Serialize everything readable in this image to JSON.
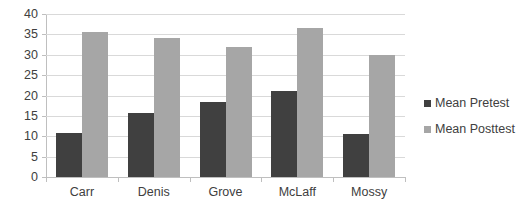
{
  "chart_data": {
    "type": "bar",
    "title": "",
    "xlabel": "",
    "ylabel": "",
    "categories": [
      "Carr",
      "Denis",
      "Grove",
      "McLaff",
      "Mossy"
    ],
    "series": [
      {
        "name": "Mean Pretest",
        "color": "#404040",
        "values": [
          10.8,
          15.8,
          18.3,
          21.0,
          10.5
        ]
      },
      {
        "name": "Mean Posttest",
        "color": "#a6a6a6",
        "values": [
          35.5,
          34.0,
          32.0,
          36.6,
          30.0
        ]
      }
    ],
    "ylim": [
      0,
      40
    ],
    "ytick_step": 5,
    "yticks": [
      40,
      35,
      30,
      25,
      20,
      15,
      10,
      5,
      0
    ],
    "ytick_labels": [
      "40",
      "35",
      "30",
      "25",
      "20",
      "15",
      "10",
      "5",
      "0"
    ],
    "grid": true,
    "grid_axis": "y",
    "legend": true,
    "legend_position": "right",
    "legend_entries": [
      "Mean Pretest",
      "Mean Posttest"
    ]
  },
  "colors": {
    "pretest": "#404040",
    "posttest": "#a6a6a6",
    "gridline": "#d9d9d9",
    "axis": "#bfbfbf",
    "text": "#404040",
    "background": "#ffffff"
  }
}
